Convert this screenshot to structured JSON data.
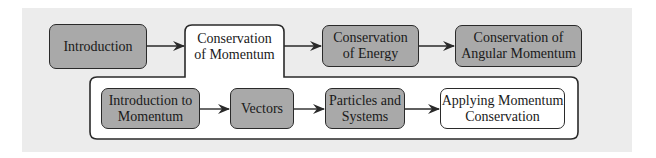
{
  "diagram": {
    "top_row": [
      {
        "id": "introduction",
        "label": "Introduction"
      },
      {
        "id": "conservation-of-momentum",
        "label": "Conservation\nof Momentum"
      },
      {
        "id": "conservation-of-energy",
        "label": "Conservation\nof Energy"
      },
      {
        "id": "conservation-of-angular-momentum",
        "label": "Conservation of\nAngular Momentum"
      }
    ],
    "sub_row": [
      {
        "id": "introduction-to-momentum",
        "label": "Introduction to\nMomentum"
      },
      {
        "id": "vectors",
        "label": "Vectors"
      },
      {
        "id": "particles-and-systems",
        "label": "Particles and\nSystems"
      },
      {
        "id": "applying-momentum-conservation",
        "label": "Applying Momentum\nConservation"
      }
    ],
    "colors": {
      "background": "#ececec",
      "node_fill_gray": "#a9a9a9",
      "node_fill_highlight": "#ffffff",
      "stroke": "#2a2a2a"
    }
  }
}
